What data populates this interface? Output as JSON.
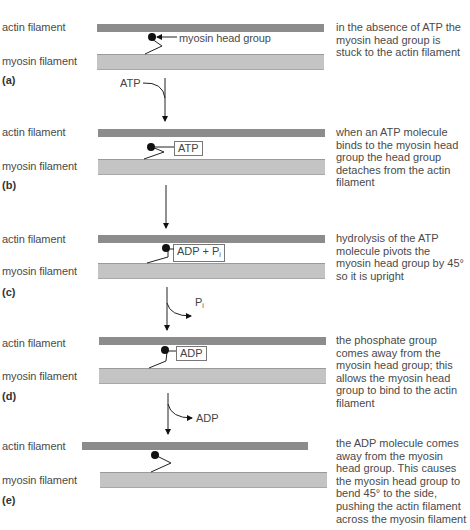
{
  "labels": {
    "actin": "actin filament",
    "myosin": "myosin filament",
    "head_callout": "myosin head group"
  },
  "panels": [
    {
      "letter": "(a)",
      "description": "in the absence of ATP the myosin head group is stuck to the actin filament",
      "molecule_label": ""
    },
    {
      "letter": "(b)",
      "description": "when an ATP molecule binds to the myosin head group the head group detaches from the actin filament",
      "molecule_label": "ATP"
    },
    {
      "letter": "(c)",
      "description": "hydrolysis of the ATP molecule pivots the myosin head group by 45° so it is upright",
      "molecule_label": "ADP + P",
      "molecule_subscript": "i"
    },
    {
      "letter": "(d)",
      "description": "the phosphate group comes away from the myosin head group; this allows the myosin head group to bind to the actin filament",
      "molecule_label": "ADP"
    },
    {
      "letter": "(e)",
      "description": "the ADP molecule comes away from the myosin head group. This causes the myosin head group to bend 45° to the side, pushing the actin filament across the myosin filament",
      "molecule_label": ""
    }
  ],
  "transitions": [
    {
      "from": "(a)",
      "to": "(b)",
      "label": "ATP",
      "direction": "in"
    },
    {
      "from": "(b)",
      "to": "(c)",
      "label": "",
      "direction": "none"
    },
    {
      "from": "(c)",
      "to": "(d)",
      "label": "P",
      "label_subscript": "i",
      "direction": "out"
    },
    {
      "from": "(d)",
      "to": "(e)",
      "label": "ADP",
      "direction": "out"
    }
  ],
  "colors": {
    "actin": "#8c8c8c",
    "myosin": "#c4c4c4",
    "head": "#111111",
    "text": "#4a4a4a"
  }
}
